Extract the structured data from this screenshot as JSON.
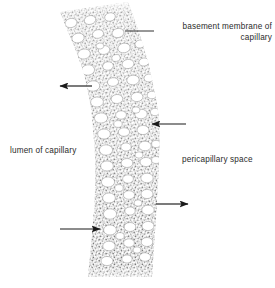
{
  "figure": {
    "background_color": "#ffffff",
    "width": 275,
    "height": 288
  },
  "labels": {
    "basement_membrane": "basement membrane of\ncapillary",
    "lumen": "lumen of capillary",
    "pericapillary_space": "pericapillary space"
  },
  "colors": {
    "text": "#2b2b2b",
    "stipple": "#8a8a8a",
    "stipple_dark": "#6e6e6e",
    "pore_fill": "#ffffff",
    "pore_stroke": "#9a9a9a",
    "arrow": "#1a1a1a",
    "leader": "#1a1a1a"
  },
  "annotations": {
    "leader_line": {
      "name": "basement-membrane-leader-line",
      "x1": 125,
      "y1": 31,
      "x2": 154,
      "y2": 31
    },
    "arrows": [
      {
        "name": "arrow-outward-left-upper",
        "direction": "left",
        "tail_x": 92,
        "tail_y": 86,
        "head_x": 60,
        "head_y": 86
      },
      {
        "name": "arrow-inward-right-upper",
        "direction": "left",
        "tail_x": 186,
        "tail_y": 124,
        "head_x": 152,
        "head_y": 124
      },
      {
        "name": "arrow-outward-right-lower",
        "direction": "right",
        "tail_x": 156,
        "tail_y": 204,
        "head_x": 188,
        "head_y": 204
      },
      {
        "name": "arrow-inward-left-lower",
        "direction": "right",
        "tail_x": 60,
        "tail_y": 229,
        "head_x": 100,
        "head_y": 229
      }
    ]
  },
  "chart_data": {
    "type": "diagram",
    "regions": [
      {
        "name": "lumen of capillary",
        "side": "left"
      },
      {
        "name": "capillary wall band",
        "side": "center",
        "texture": "stipple"
      },
      {
        "name": "pericapillary space",
        "side": "right"
      }
    ],
    "band_path_left": "M 60 12 L 83 70 L 93 128 L 95 190 L 92 250 L 88 276",
    "band_path_right": "M 128 2 L 148 62 L 159 120 L 158 186 L 155 248 L 152 276",
    "pore_count": 64,
    "pores": [
      {
        "cx": 71,
        "cy": 23,
        "rx": 6.0,
        "ry": 4.6,
        "rot": -14
      },
      {
        "cx": 90,
        "cy": 20,
        "rx": 5.8,
        "ry": 4.4,
        "rot": -14
      },
      {
        "cx": 110,
        "cy": 17,
        "rx": 5.4,
        "ry": 4.2,
        "rot": -14
      },
      {
        "cx": 78,
        "cy": 38,
        "rx": 6.2,
        "ry": 4.8,
        "rot": -12
      },
      {
        "cx": 98,
        "cy": 34,
        "rx": 5.6,
        "ry": 4.3,
        "rot": -12
      },
      {
        "cx": 118,
        "cy": 33,
        "rx": 6.0,
        "ry": 4.6,
        "rot": -12
      },
      {
        "cx": 84,
        "cy": 54,
        "rx": 6.4,
        "ry": 5.0,
        "rot": -10
      },
      {
        "cx": 104,
        "cy": 50,
        "rx": 5.8,
        "ry": 4.4,
        "rot": -10
      },
      {
        "cx": 124,
        "cy": 48,
        "rx": 6.2,
        "ry": 4.8,
        "rot": -10
      },
      {
        "cx": 140,
        "cy": 44,
        "rx": 5.0,
        "ry": 4.0,
        "rot": -10
      },
      {
        "cx": 88,
        "cy": 70,
        "rx": 6.6,
        "ry": 5.2,
        "rot": -8
      },
      {
        "cx": 108,
        "cy": 66,
        "rx": 5.4,
        "ry": 4.2,
        "rot": -8
      },
      {
        "cx": 128,
        "cy": 64,
        "rx": 6.0,
        "ry": 4.6,
        "rot": -8
      },
      {
        "cx": 144,
        "cy": 62,
        "rx": 5.2,
        "ry": 4.0,
        "rot": -8
      },
      {
        "cx": 93,
        "cy": 86,
        "rx": 6.8,
        "ry": 5.2,
        "rot": -6
      },
      {
        "cx": 113,
        "cy": 82,
        "rx": 5.6,
        "ry": 4.3,
        "rot": -6
      },
      {
        "cx": 133,
        "cy": 80,
        "rx": 6.2,
        "ry": 4.8,
        "rot": -6
      },
      {
        "cx": 149,
        "cy": 78,
        "rx": 5.0,
        "ry": 3.9,
        "rot": -6
      },
      {
        "cx": 97,
        "cy": 102,
        "rx": 6.4,
        "ry": 5.0,
        "rot": -4
      },
      {
        "cx": 117,
        "cy": 99,
        "rx": 5.8,
        "ry": 4.5,
        "rot": -4
      },
      {
        "cx": 137,
        "cy": 97,
        "rx": 6.0,
        "ry": 4.6,
        "rot": -4
      },
      {
        "cx": 152,
        "cy": 95,
        "rx": 4.8,
        "ry": 3.8,
        "rot": -4
      },
      {
        "cx": 101,
        "cy": 118,
        "rx": 6.6,
        "ry": 5.1,
        "rot": -2
      },
      {
        "cx": 121,
        "cy": 115,
        "rx": 5.4,
        "ry": 4.2,
        "rot": -2
      },
      {
        "cx": 141,
        "cy": 114,
        "rx": 6.2,
        "ry": 4.8,
        "rot": -2
      },
      {
        "cx": 155,
        "cy": 112,
        "rx": 4.6,
        "ry": 3.7,
        "rot": -2
      },
      {
        "cx": 104,
        "cy": 134,
        "rx": 6.4,
        "ry": 5.0,
        "rot": 0
      },
      {
        "cx": 124,
        "cy": 132,
        "rx": 5.6,
        "ry": 4.3,
        "rot": 0
      },
      {
        "cx": 143,
        "cy": 130,
        "rx": 6.0,
        "ry": 4.6,
        "rot": 0
      },
      {
        "cx": 106,
        "cy": 150,
        "rx": 6.6,
        "ry": 5.2,
        "rot": 0
      },
      {
        "cx": 126,
        "cy": 147,
        "rx": 5.2,
        "ry": 4.1,
        "rot": 0
      },
      {
        "cx": 145,
        "cy": 146,
        "rx": 6.2,
        "ry": 4.8,
        "rot": 0
      },
      {
        "cx": 156,
        "cy": 144,
        "rx": 4.4,
        "ry": 3.6,
        "rot": 0
      },
      {
        "cx": 107,
        "cy": 166,
        "rx": 6.4,
        "ry": 5.0,
        "rot": 0
      },
      {
        "cx": 127,
        "cy": 163,
        "rx": 5.8,
        "ry": 4.5,
        "rot": 0
      },
      {
        "cx": 146,
        "cy": 162,
        "rx": 6.0,
        "ry": 4.6,
        "rot": 0
      },
      {
        "cx": 156,
        "cy": 160,
        "rx": 4.4,
        "ry": 3.5,
        "rot": 0
      },
      {
        "cx": 108,
        "cy": 182,
        "rx": 6.6,
        "ry": 5.1,
        "rot": 0
      },
      {
        "cx": 128,
        "cy": 179,
        "rx": 5.4,
        "ry": 4.2,
        "rot": 0
      },
      {
        "cx": 147,
        "cy": 178,
        "rx": 6.2,
        "ry": 4.8,
        "rot": 0
      },
      {
        "cx": 109,
        "cy": 198,
        "rx": 6.4,
        "ry": 5.0,
        "rot": 0
      },
      {
        "cx": 129,
        "cy": 195,
        "rx": 5.6,
        "ry": 4.3,
        "rot": 0
      },
      {
        "cx": 147,
        "cy": 194,
        "rx": 6.0,
        "ry": 4.6,
        "rot": 0
      },
      {
        "cx": 110,
        "cy": 214,
        "rx": 6.6,
        "ry": 5.2,
        "rot": 0
      },
      {
        "cx": 130,
        "cy": 211,
        "rx": 5.2,
        "ry": 4.1,
        "rot": 0
      },
      {
        "cx": 148,
        "cy": 210,
        "rx": 6.2,
        "ry": 4.8,
        "rot": 0
      },
      {
        "cx": 110,
        "cy": 230,
        "rx": 6.4,
        "ry": 5.0,
        "rot": 0
      },
      {
        "cx": 130,
        "cy": 227,
        "rx": 5.8,
        "ry": 4.5,
        "rot": 0
      },
      {
        "cx": 148,
        "cy": 226,
        "rx": 6.0,
        "ry": 4.6,
        "rot": 0
      },
      {
        "cx": 109,
        "cy": 246,
        "rx": 6.2,
        "ry": 4.8,
        "rot": 0
      },
      {
        "cx": 129,
        "cy": 243,
        "rx": 5.4,
        "ry": 4.2,
        "rot": 0
      },
      {
        "cx": 147,
        "cy": 242,
        "rx": 5.8,
        "ry": 4.5,
        "rot": 0
      },
      {
        "cx": 107,
        "cy": 261,
        "rx": 6.0,
        "ry": 4.6,
        "rot": 0
      },
      {
        "cx": 127,
        "cy": 259,
        "rx": 5.2,
        "ry": 4.0,
        "rot": 0
      },
      {
        "cx": 145,
        "cy": 257,
        "rx": 5.6,
        "ry": 4.3,
        "rot": 0
      },
      {
        "cx": 116,
        "cy": 58,
        "rx": 4.2,
        "ry": 3.4,
        "rot": -10
      },
      {
        "cx": 136,
        "cy": 110,
        "rx": 4.0,
        "ry": 3.2,
        "rot": 0
      },
      {
        "cx": 118,
        "cy": 124,
        "rx": 4.2,
        "ry": 3.4,
        "rot": 0
      },
      {
        "cx": 139,
        "cy": 155,
        "rx": 4.0,
        "ry": 3.2,
        "rot": 0
      },
      {
        "cx": 119,
        "cy": 188,
        "rx": 4.2,
        "ry": 3.4,
        "rot": 0
      },
      {
        "cx": 138,
        "cy": 203,
        "rx": 4.0,
        "ry": 3.2,
        "rot": 0
      },
      {
        "cx": 120,
        "cy": 236,
        "rx": 4.2,
        "ry": 3.4,
        "rot": 0
      },
      {
        "cx": 137,
        "cy": 250,
        "rx": 4.0,
        "ry": 3.2,
        "rot": 0
      },
      {
        "cx": 100,
        "cy": 46,
        "rx": 3.8,
        "ry": 3.0,
        "rot": -12
      }
    ]
  }
}
